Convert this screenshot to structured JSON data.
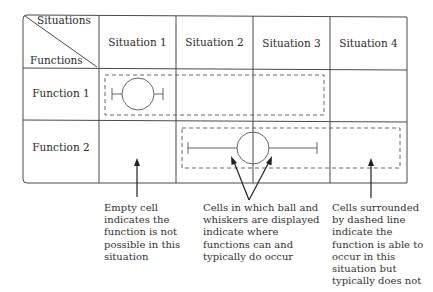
{
  "header": {
    "corner_top": "Situations",
    "corner_bottom": "Functions",
    "situations": [
      "Situation 1",
      "Situation 2",
      "Situation 3",
      "Situation 4"
    ]
  },
  "rows": [
    {
      "label": "Function 1"
    },
    {
      "label": "Function 2"
    }
  ],
  "notes": {
    "empty_cell": "Empty cell indicates the function is not possible in this situation",
    "ball_whiskers": "Cells in which ball and whiskers are displayed indicate where functions can and typically do occur",
    "dashed": "Cells surrounded by dashed line indicate the function is able to occur in this situation but typically does not"
  },
  "colors": {
    "line": "#4a4a4a",
    "text": "#2a2a2a"
  }
}
